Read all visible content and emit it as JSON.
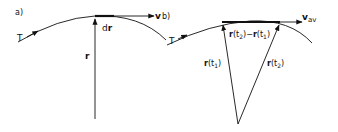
{
  "panels": {
    "a": {
      "label": "a)",
      "curve_label": "T",
      "position_vector_label": "r",
      "displacement_label_prefix": "d",
      "displacement_label_vec": "r",
      "velocity_label": "v"
    },
    "b": {
      "label": "b)",
      "curve_label": "T",
      "r1_vec": "r",
      "r1_arg": "(t",
      "r1_sub": "1",
      "r1_close": ")",
      "r2_vec": "r",
      "r2_arg": "(t",
      "r2_sub": "2",
      "r2_close": ")",
      "diff_a_vec": "r",
      "diff_a_arg": "(t",
      "diff_a_sub": "2",
      "diff_a_close": ")",
      "diff_minus": "−",
      "diff_b_vec": "r",
      "diff_b_arg": "(t",
      "diff_b_sub": "1",
      "diff_b_close": ")",
      "velocity_vec": "v",
      "velocity_sub": "av"
    }
  },
  "colors": {
    "ink": "#111111",
    "background": "#ffffff"
  }
}
